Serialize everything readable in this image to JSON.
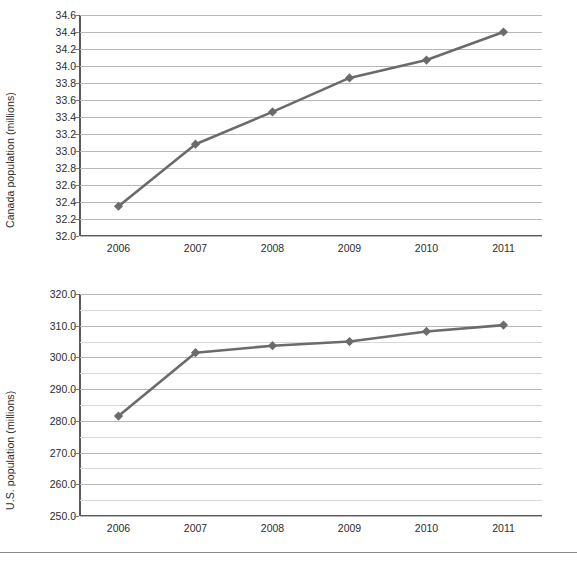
{
  "chart_data": [
    {
      "id": "canada",
      "type": "line",
      "title": "",
      "xlabel": "",
      "ylabel": "Canada population (millions)",
      "categories": [
        "2006",
        "2007",
        "2008",
        "2009",
        "2010",
        "2011"
      ],
      "values": [
        32.35,
        33.08,
        33.46,
        33.86,
        34.07,
        34.4
      ],
      "ylim": [
        32.0,
        34.6
      ],
      "ytick_step": 0.2,
      "ytick_labels": [
        "34.6",
        "34.4",
        "34.2",
        "34.0",
        "33.8",
        "33.6",
        "33.4",
        "33.2",
        "33.0",
        "32.8",
        "32.6",
        "32.4",
        "32.2",
        "32.0"
      ],
      "grid": "horizontal",
      "legend": "none",
      "marker": "diamond",
      "series_color": "#6b6b6b",
      "grid_color": "#b8b8b8",
      "axis_color": "#595959"
    },
    {
      "id": "us",
      "type": "line",
      "title": "",
      "xlabel": "",
      "ylabel": "U.S. population (millions)",
      "categories": [
        "2006",
        "2007",
        "2008",
        "2009",
        "2010",
        "2011"
      ],
      "values": [
        281.5,
        301.5,
        303.7,
        305.0,
        308.2,
        310.2
      ],
      "ylim": [
        250.0,
        320.0
      ],
      "ytick_step": 10.0,
      "minor_tick_step": 5.0,
      "ytick_labels": [
        "320.0",
        "310.0",
        "300.0",
        "290.0",
        "280.0",
        "270.0",
        "260.0",
        "250.0"
      ],
      "grid": "horizontal",
      "legend": "none",
      "marker": "diamond",
      "series_color": "#6b6b6b",
      "grid_color": "#b8b8b8",
      "axis_color": "#595959"
    }
  ],
  "footer": {
    "text": ""
  }
}
